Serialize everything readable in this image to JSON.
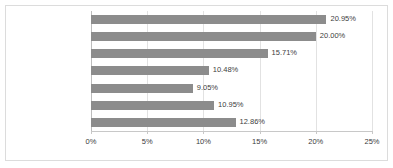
{
  "chart_data": {
    "type": "bar",
    "orientation": "horizontal",
    "title": "",
    "xlabel": "",
    "ylabel": "",
    "xlim": [
      0,
      25
    ],
    "grid": true,
    "legend": false,
    "bar_color": "#8c8c8c",
    "categories": [
      "梯田花香",
      "商铺中的皇菊茶香",
      "田间青草香",
      "泥土味",
      "饭菜香",
      "炊烟的气味",
      "其他"
    ],
    "values": [
      20.95,
      20.0,
      15.71,
      10.48,
      9.05,
      10.95,
      12.86
    ],
    "value_labels": [
      "20.95%",
      "20.00%",
      "15.71%",
      "10.48%",
      "9.05%",
      "10.95%",
      "12.86%"
    ],
    "x_ticks": [
      0,
      5,
      10,
      15,
      20,
      25
    ],
    "x_tick_labels": [
      "0%",
      "5%",
      "10%",
      "15%",
      "20%",
      "25%"
    ]
  }
}
